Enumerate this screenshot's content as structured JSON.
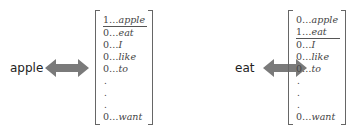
{
  "panels": [
    {
      "word": "apple",
      "vector": [
        {
          "value": "1",
          "token": "apple",
          "active": true
        },
        {
          "value": "0",
          "token": "eat",
          "active": false
        },
        {
          "value": "0",
          "token": "I",
          "active": false
        },
        {
          "value": "0",
          "token": "like",
          "active": false
        },
        {
          "value": "0",
          "token": "to",
          "active": false
        },
        {
          "ellipsis": "."
        },
        {
          "ellipsis": "."
        },
        {
          "ellipsis": "."
        },
        {
          "value": "0",
          "token": "want",
          "active": false
        }
      ]
    },
    {
      "word": "eat",
      "vector": [
        {
          "value": "0",
          "token": "apple",
          "active": false
        },
        {
          "value": "1",
          "token": "eat",
          "active": true
        },
        {
          "value": "0",
          "token": "I",
          "active": false
        },
        {
          "value": "0",
          "token": "like",
          "active": false
        },
        {
          "value": "0",
          "token": "to",
          "active": false
        },
        {
          "ellipsis": "."
        },
        {
          "ellipsis": "."
        },
        {
          "ellipsis": "."
        },
        {
          "value": "0",
          "token": "want",
          "active": false
        }
      ]
    }
  ],
  "separator": "…",
  "colors": {
    "arrow": "#7a7a7a",
    "text": "#222222",
    "bracket": "#666666"
  }
}
